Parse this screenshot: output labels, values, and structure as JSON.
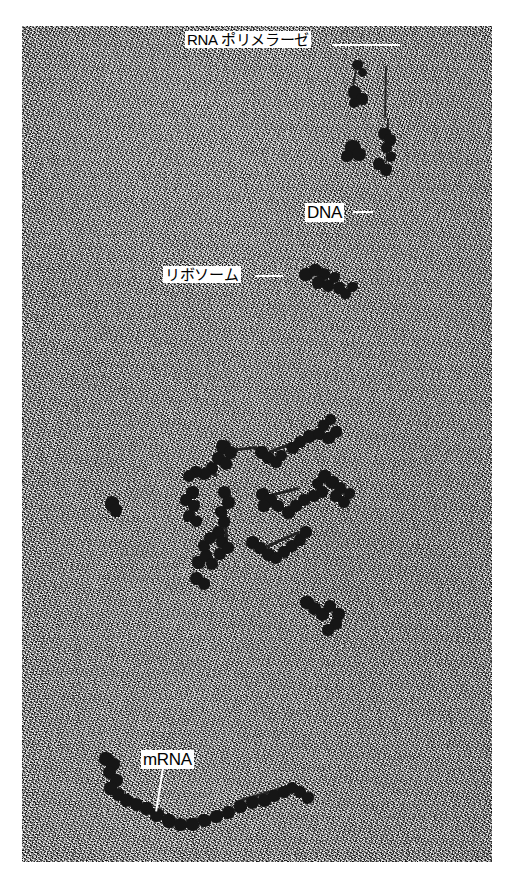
{
  "figure": {
    "kind": "electron-micrograph",
    "plate": {
      "left": 22,
      "top": 26,
      "width": 470,
      "height": 836,
      "background_color": "#8c8c8c",
      "page_background": "#ffffff"
    },
    "labels": [
      {
        "id": "rna-polymerase",
        "text": "RNA ポリメラーゼ",
        "script": "jp",
        "x": 185,
        "y": 31,
        "leader": {
          "x": 332,
          "y": 45,
          "length": 68,
          "angle": 0,
          "thickness": 2
        }
      },
      {
        "id": "dna",
        "text": "DNA",
        "script": "en",
        "x": 305,
        "y": 203,
        "leader": {
          "x": 353,
          "y": 212,
          "length": 20,
          "angle": 0,
          "thickness": 2
        }
      },
      {
        "id": "ribosome",
        "text": "リボソーム",
        "script": "jp",
        "x": 163,
        "y": 266,
        "leader": {
          "x": 255,
          "y": 276,
          "length": 28,
          "angle": 0,
          "thickness": 2
        }
      },
      {
        "id": "mrna",
        "text": "mRNA",
        "script": "en",
        "x": 141,
        "y": 750,
        "leader": {
          "x": 163,
          "y": 768,
          "length": 44,
          "angle": 99,
          "thickness": 2
        }
      }
    ],
    "particles": [
      {
        "x": 352,
        "y": 60,
        "w": 11,
        "h": 10
      },
      {
        "x": 358,
        "y": 68,
        "w": 9,
        "h": 9
      },
      {
        "x": 348,
        "y": 86,
        "w": 13,
        "h": 13
      },
      {
        "x": 356,
        "y": 93,
        "w": 12,
        "h": 12
      },
      {
        "x": 349,
        "y": 98,
        "w": 10,
        "h": 10
      },
      {
        "x": 345,
        "y": 140,
        "w": 16,
        "h": 15
      },
      {
        "x": 352,
        "y": 148,
        "w": 14,
        "h": 13
      },
      {
        "x": 341,
        "y": 150,
        "w": 12,
        "h": 12
      },
      {
        "x": 378,
        "y": 128,
        "w": 13,
        "h": 12
      },
      {
        "x": 384,
        "y": 134,
        "w": 12,
        "h": 12
      },
      {
        "x": 381,
        "y": 142,
        "w": 11,
        "h": 11
      },
      {
        "x": 386,
        "y": 152,
        "w": 10,
        "h": 10
      },
      {
        "x": 373,
        "y": 158,
        "w": 12,
        "h": 12
      },
      {
        "x": 380,
        "y": 164,
        "w": 12,
        "h": 12
      },
      {
        "x": 299,
        "y": 268,
        "w": 14,
        "h": 13
      },
      {
        "x": 309,
        "y": 264,
        "w": 13,
        "h": 12
      },
      {
        "x": 318,
        "y": 268,
        "w": 12,
        "h": 12
      },
      {
        "x": 312,
        "y": 276,
        "w": 13,
        "h": 13
      },
      {
        "x": 322,
        "y": 280,
        "w": 12,
        "h": 12
      },
      {
        "x": 329,
        "y": 272,
        "w": 11,
        "h": 11
      },
      {
        "x": 333,
        "y": 282,
        "w": 12,
        "h": 12
      },
      {
        "x": 340,
        "y": 288,
        "w": 11,
        "h": 11
      },
      {
        "x": 347,
        "y": 282,
        "w": 11,
        "h": 10
      },
      {
        "x": 105,
        "y": 496,
        "w": 14,
        "h": 16
      },
      {
        "x": 110,
        "y": 504,
        "w": 12,
        "h": 13
      },
      {
        "x": 216,
        "y": 440,
        "w": 15,
        "h": 14
      },
      {
        "x": 224,
        "y": 446,
        "w": 13,
        "h": 13
      },
      {
        "x": 212,
        "y": 452,
        "w": 13,
        "h": 13
      },
      {
        "x": 220,
        "y": 458,
        "w": 12,
        "h": 12
      },
      {
        "x": 206,
        "y": 462,
        "w": 12,
        "h": 12
      },
      {
        "x": 198,
        "y": 468,
        "w": 13,
        "h": 12
      },
      {
        "x": 190,
        "y": 466,
        "w": 12,
        "h": 12
      },
      {
        "x": 183,
        "y": 470,
        "w": 12,
        "h": 12
      },
      {
        "x": 255,
        "y": 446,
        "w": 13,
        "h": 13
      },
      {
        "x": 262,
        "y": 452,
        "w": 13,
        "h": 12
      },
      {
        "x": 270,
        "y": 456,
        "w": 12,
        "h": 12
      },
      {
        "x": 276,
        "y": 450,
        "w": 11,
        "h": 11
      },
      {
        "x": 287,
        "y": 442,
        "w": 12,
        "h": 12
      },
      {
        "x": 294,
        "y": 436,
        "w": 12,
        "h": 12
      },
      {
        "x": 303,
        "y": 430,
        "w": 13,
        "h": 13
      },
      {
        "x": 313,
        "y": 428,
        "w": 12,
        "h": 12
      },
      {
        "x": 322,
        "y": 432,
        "w": 13,
        "h": 12
      },
      {
        "x": 330,
        "y": 426,
        "w": 12,
        "h": 12
      },
      {
        "x": 318,
        "y": 420,
        "w": 11,
        "h": 11
      },
      {
        "x": 325,
        "y": 414,
        "w": 11,
        "h": 11
      },
      {
        "x": 218,
        "y": 486,
        "w": 13,
        "h": 13
      },
      {
        "x": 222,
        "y": 496,
        "w": 13,
        "h": 13
      },
      {
        "x": 215,
        "y": 506,
        "w": 12,
        "h": 12
      },
      {
        "x": 218,
        "y": 516,
        "w": 12,
        "h": 12
      },
      {
        "x": 212,
        "y": 526,
        "w": 13,
        "h": 13
      },
      {
        "x": 216,
        "y": 536,
        "w": 12,
        "h": 12
      },
      {
        "x": 256,
        "y": 488,
        "w": 13,
        "h": 13
      },
      {
        "x": 264,
        "y": 494,
        "w": 13,
        "h": 13
      },
      {
        "x": 258,
        "y": 500,
        "w": 12,
        "h": 12
      },
      {
        "x": 272,
        "y": 500,
        "w": 12,
        "h": 12
      },
      {
        "x": 282,
        "y": 506,
        "w": 13,
        "h": 13
      },
      {
        "x": 290,
        "y": 500,
        "w": 12,
        "h": 12
      },
      {
        "x": 298,
        "y": 494,
        "w": 12,
        "h": 12
      },
      {
        "x": 308,
        "y": 490,
        "w": 12,
        "h": 12
      },
      {
        "x": 316,
        "y": 486,
        "w": 12,
        "h": 12
      },
      {
        "x": 312,
        "y": 478,
        "w": 11,
        "h": 11
      },
      {
        "x": 318,
        "y": 470,
        "w": 13,
        "h": 13
      },
      {
        "x": 326,
        "y": 476,
        "w": 13,
        "h": 13
      },
      {
        "x": 334,
        "y": 482,
        "w": 12,
        "h": 12
      },
      {
        "x": 330,
        "y": 490,
        "w": 12,
        "h": 12
      },
      {
        "x": 338,
        "y": 496,
        "w": 12,
        "h": 12
      },
      {
        "x": 344,
        "y": 488,
        "w": 11,
        "h": 11
      },
      {
        "x": 246,
        "y": 536,
        "w": 13,
        "h": 13
      },
      {
        "x": 254,
        "y": 542,
        "w": 12,
        "h": 12
      },
      {
        "x": 262,
        "y": 548,
        "w": 13,
        "h": 13
      },
      {
        "x": 270,
        "y": 552,
        "w": 12,
        "h": 12
      },
      {
        "x": 278,
        "y": 546,
        "w": 12,
        "h": 12
      },
      {
        "x": 286,
        "y": 540,
        "w": 12,
        "h": 12
      },
      {
        "x": 294,
        "y": 534,
        "w": 12,
        "h": 12
      },
      {
        "x": 300,
        "y": 526,
        "w": 12,
        "h": 12
      },
      {
        "x": 192,
        "y": 556,
        "w": 13,
        "h": 13
      },
      {
        "x": 200,
        "y": 550,
        "w": 12,
        "h": 12
      },
      {
        "x": 206,
        "y": 558,
        "w": 12,
        "h": 12
      },
      {
        "x": 214,
        "y": 548,
        "w": 12,
        "h": 12
      },
      {
        "x": 222,
        "y": 542,
        "w": 12,
        "h": 12
      },
      {
        "x": 190,
        "y": 572,
        "w": 13,
        "h": 13
      },
      {
        "x": 198,
        "y": 578,
        "w": 12,
        "h": 12
      },
      {
        "x": 186,
        "y": 486,
        "w": 13,
        "h": 13
      },
      {
        "x": 180,
        "y": 494,
        "w": 12,
        "h": 12
      },
      {
        "x": 188,
        "y": 500,
        "w": 12,
        "h": 12
      },
      {
        "x": 183,
        "y": 510,
        "w": 12,
        "h": 12
      },
      {
        "x": 191,
        "y": 516,
        "w": 11,
        "h": 11
      },
      {
        "x": 198,
        "y": 540,
        "w": 12,
        "h": 12
      },
      {
        "x": 204,
        "y": 532,
        "w": 12,
        "h": 12
      },
      {
        "x": 300,
        "y": 596,
        "w": 14,
        "h": 13
      },
      {
        "x": 308,
        "y": 602,
        "w": 13,
        "h": 13
      },
      {
        "x": 316,
        "y": 608,
        "w": 13,
        "h": 13
      },
      {
        "x": 324,
        "y": 600,
        "w": 12,
        "h": 12
      },
      {
        "x": 332,
        "y": 608,
        "w": 13,
        "h": 13
      },
      {
        "x": 330,
        "y": 618,
        "w": 12,
        "h": 12
      },
      {
        "x": 322,
        "y": 624,
        "w": 12,
        "h": 12
      },
      {
        "x": 99,
        "y": 752,
        "w": 14,
        "h": 14
      },
      {
        "x": 107,
        "y": 758,
        "w": 13,
        "h": 13
      },
      {
        "x": 103,
        "y": 766,
        "w": 13,
        "h": 13
      },
      {
        "x": 110,
        "y": 774,
        "w": 13,
        "h": 13
      },
      {
        "x": 104,
        "y": 782,
        "w": 13,
        "h": 13
      },
      {
        "x": 112,
        "y": 788,
        "w": 13,
        "h": 13
      },
      {
        "x": 120,
        "y": 794,
        "w": 13,
        "h": 13
      },
      {
        "x": 130,
        "y": 798,
        "w": 13,
        "h": 13
      },
      {
        "x": 140,
        "y": 802,
        "w": 13,
        "h": 13
      },
      {
        "x": 150,
        "y": 808,
        "w": 14,
        "h": 14
      },
      {
        "x": 162,
        "y": 814,
        "w": 14,
        "h": 14
      },
      {
        "x": 174,
        "y": 818,
        "w": 13,
        "h": 13
      },
      {
        "x": 186,
        "y": 818,
        "w": 13,
        "h": 13
      },
      {
        "x": 198,
        "y": 814,
        "w": 13,
        "h": 13
      },
      {
        "x": 210,
        "y": 810,
        "w": 13,
        "h": 13
      },
      {
        "x": 222,
        "y": 806,
        "w": 13,
        "h": 13
      },
      {
        "x": 234,
        "y": 800,
        "w": 13,
        "h": 13
      },
      {
        "x": 246,
        "y": 796,
        "w": 13,
        "h": 13
      },
      {
        "x": 258,
        "y": 794,
        "w": 13,
        "h": 13
      },
      {
        "x": 268,
        "y": 790,
        "w": 12,
        "h": 12
      },
      {
        "x": 278,
        "y": 786,
        "w": 12,
        "h": 12
      },
      {
        "x": 286,
        "y": 782,
        "w": 12,
        "h": 12
      },
      {
        "x": 294,
        "y": 786,
        "w": 12,
        "h": 12
      },
      {
        "x": 302,
        "y": 792,
        "w": 12,
        "h": 12
      }
    ],
    "strands": [
      {
        "x": 386,
        "y": 66,
        "length": 52,
        "angle": 91,
        "thickness": 2
      },
      {
        "x": 388,
        "y": 118,
        "length": 44,
        "angle": 92,
        "thickness": 2
      },
      {
        "x": 356,
        "y": 70,
        "length": 20,
        "angle": 100,
        "thickness": 2
      },
      {
        "x": 228,
        "y": 450,
        "length": 30,
        "angle": -6,
        "thickness": 3
      },
      {
        "x": 268,
        "y": 452,
        "length": 26,
        "angle": -20,
        "thickness": 3
      },
      {
        "x": 196,
        "y": 470,
        "length": 22,
        "angle": 12,
        "thickness": 3
      },
      {
        "x": 224,
        "y": 500,
        "length": 40,
        "angle": 86,
        "thickness": 3
      },
      {
        "x": 266,
        "y": 496,
        "length": 34,
        "angle": -14,
        "thickness": 3
      },
      {
        "x": 258,
        "y": 550,
        "length": 46,
        "angle": -24,
        "thickness": 3
      },
      {
        "x": 118,
        "y": 796,
        "length": 40,
        "angle": 22,
        "thickness": 3
      },
      {
        "x": 186,
        "y": 820,
        "length": 40,
        "angle": -8,
        "thickness": 3
      },
      {
        "x": 240,
        "y": 800,
        "length": 50,
        "angle": -16,
        "thickness": 3
      }
    ]
  }
}
